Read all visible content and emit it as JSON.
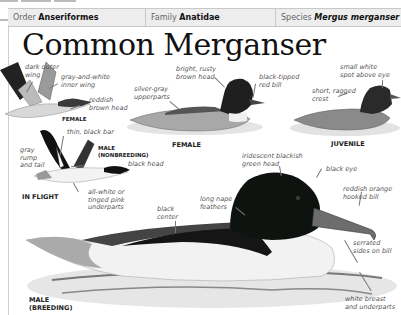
{
  "header": {
    "order_label": "Order",
    "order_value": "Anseriformes",
    "family_label": "Family",
    "family_value": "Anatidae",
    "species_label": "Species",
    "species_value": "Mergus merganser"
  },
  "title": "Common Merganser",
  "figures": {
    "flight_female": {
      "caption": "FEMALE",
      "labels": [
        "dark outer wing",
        "gray-and-white inner wing",
        "reddish brown head"
      ]
    },
    "flight_male": {
      "caption": "MALE (NONBREEDING)",
      "section_caption": "IN FLIGHT",
      "labels": [
        "thin, black bar",
        "gray rump and tail",
        "black head",
        "all-white or tinged pink underparts"
      ]
    },
    "female": {
      "caption": "FEMALE",
      "labels": [
        "bright, rusty brown head",
        "silver-gray upperparts",
        "black-tipped red bill"
      ]
    },
    "juvenile": {
      "caption": "JUVENILE",
      "labels": [
        "small white spot above eye",
        "short, ragged crest"
      ]
    },
    "male_breeding": {
      "caption": "MALE (BREEDING)",
      "labels": [
        "iridescent blackish green head",
        "black eye",
        "reddish orange hooked bill",
        "long nape feathers",
        "black center",
        "serrated sides on bill",
        "white breast and underparts"
      ]
    }
  },
  "text": {
    "dark_outer_1": "dark outer",
    "dark_outer_2": "wing",
    "gw_inner_1": "gray-and-white",
    "gw_inner_2": "inner wing",
    "reddish_1": "reddish",
    "reddish_2": "brown head",
    "female_flight_cap": "FEMALE",
    "thin_bar": "thin, black bar",
    "gray_rump_1": "gray",
    "gray_rump_2": "rump",
    "gray_rump_3": "and tail",
    "male_nb_1": "MALE",
    "male_nb_2": "(NONBREEDING)",
    "black_head": "black head",
    "in_flight": "IN FLIGHT",
    "allwhite_1": "all-white or",
    "allwhite_2": "tinged pink",
    "allwhite_3": "underparts",
    "bright_1": "bright, rusty",
    "bright_2": "brown head",
    "silver_1": "silver-gray",
    "silver_2": "upperparts",
    "blacktip_1": "black-tipped",
    "blacktip_2": "red bill",
    "female_cap": "FEMALE",
    "smallwhite_1": "small white",
    "smallwhite_2": "spot above eye",
    "short_1": "short, ragged",
    "short_2": "crest",
    "juvenile_cap": "JUVENILE",
    "irid_1": "iridescent blackish",
    "irid_2": "green head",
    "black_eye": "black eye",
    "reddish_orange_1": "reddish orange",
    "reddish_orange_2": "hooked bill",
    "long_nape_1": "long nape",
    "long_nape_2": "feathers",
    "black_center_1": "black",
    "black_center_2": "center",
    "serrated_1": "serrated",
    "serrated_2": "sides on bill",
    "white_breast_1": "white breast",
    "white_breast_2": "and underparts",
    "male_b_1": "MALE",
    "male_b_2": "(BREEDING)"
  }
}
